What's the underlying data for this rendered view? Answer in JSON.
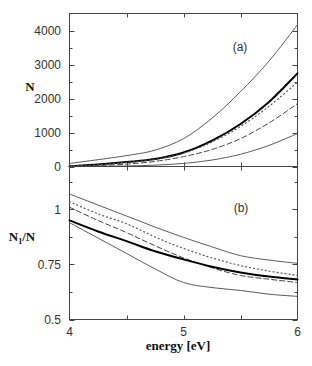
{
  "figure": {
    "xlabel": "energy [eV]",
    "panel_a": {
      "label": "(a)",
      "ylabel": "N"
    },
    "panel_b": {
      "label": "(b)",
      "ylabel_base": "N",
      "ylabel_sub": "1",
      "ylabel_rest": "/N"
    }
  },
  "chart_data": [
    {
      "type": "line",
      "panel": "(a)",
      "title": "",
      "xlabel": "energy [eV]",
      "ylabel": "N",
      "xlim": [
        4,
        6
      ],
      "ylim": [
        0,
        4500
      ],
      "grid": false,
      "legend": "none",
      "xticks": [
        4,
        4.5,
        5,
        5.5,
        6
      ],
      "xticklabels": [],
      "yticks_major": [
        0,
        1000,
        2000,
        3000,
        4000
      ],
      "yticks_minor": [
        500,
        1500,
        2500,
        3500
      ],
      "yticklabels": [
        "0",
        "1000",
        "2000",
        "3000",
        "4000"
      ],
      "x": [
        4,
        4.25,
        4.5,
        4.75,
        5,
        5.25,
        5.5,
        5.75,
        6
      ],
      "series": [
        {
          "name": "upper thin solid",
          "style": "thin-solid",
          "values": [
            90,
            200,
            320,
            480,
            820,
            1420,
            2200,
            3100,
            4170
          ]
        },
        {
          "name": "thick solid",
          "style": "thick-solid",
          "values": [
            10,
            60,
            130,
            220,
            410,
            760,
            1250,
            1900,
            2740
          ]
        },
        {
          "name": "dotted",
          "style": "dotted",
          "values": [
            10,
            55,
            120,
            210,
            390,
            720,
            1180,
            1770,
            2480
          ]
        },
        {
          "name": "dashed",
          "style": "dashed",
          "values": [
            5,
            30,
            70,
            150,
            290,
            500,
            820,
            1280,
            1850
          ]
        },
        {
          "name": "lower thin solid",
          "style": "thin-solid",
          "values": [
            0,
            5,
            15,
            40,
            90,
            190,
            360,
            620,
            970
          ]
        }
      ]
    },
    {
      "type": "line",
      "panel": "(b)",
      "title": "",
      "xlabel": "energy [eV]",
      "ylabel": "N1/N",
      "xlim": [
        4,
        6
      ],
      "ylim": [
        0.5,
        1.195
      ],
      "grid": false,
      "legend": "none",
      "xticks": [
        4,
        4.5,
        5,
        5.5,
        6
      ],
      "xticklabels": [
        "4",
        "5",
        "6"
      ],
      "xticklabel_positions": [
        4,
        5,
        6
      ],
      "yticks_major": [
        0.5,
        0.75,
        1
      ],
      "yticks_minor": [
        0.625,
        0.875,
        1.125
      ],
      "yticklabels": [
        "0.5",
        "0.75",
        "1"
      ],
      "x": [
        4,
        4.25,
        4.5,
        4.75,
        5,
        5.25,
        5.5,
        5.75,
        6
      ],
      "series": [
        {
          "name": "upper thin solid",
          "style": "thin-solid",
          "values": [
            1.07,
            1.02,
            0.97,
            0.92,
            0.873,
            0.83,
            0.79,
            0.77,
            0.755
          ]
        },
        {
          "name": "dotted",
          "style": "dotted",
          "values": [
            1.035,
            0.98,
            0.935,
            0.875,
            0.823,
            0.78,
            0.745,
            0.72,
            0.7
          ]
        },
        {
          "name": "dashed",
          "style": "dashed",
          "values": [
            1.01,
            0.95,
            0.895,
            0.835,
            0.78,
            0.735,
            0.7,
            0.683,
            0.668
          ]
        },
        {
          "name": "thick solid",
          "style": "thick-solid",
          "values": [
            0.95,
            0.9,
            0.856,
            0.81,
            0.773,
            0.74,
            0.714,
            0.695,
            0.682
          ]
        },
        {
          "name": "lower thin solid",
          "style": "thin-solid",
          "values": [
            0.94,
            0.87,
            0.8,
            0.73,
            0.668,
            0.645,
            0.632,
            0.615,
            0.605
          ]
        }
      ]
    }
  ]
}
